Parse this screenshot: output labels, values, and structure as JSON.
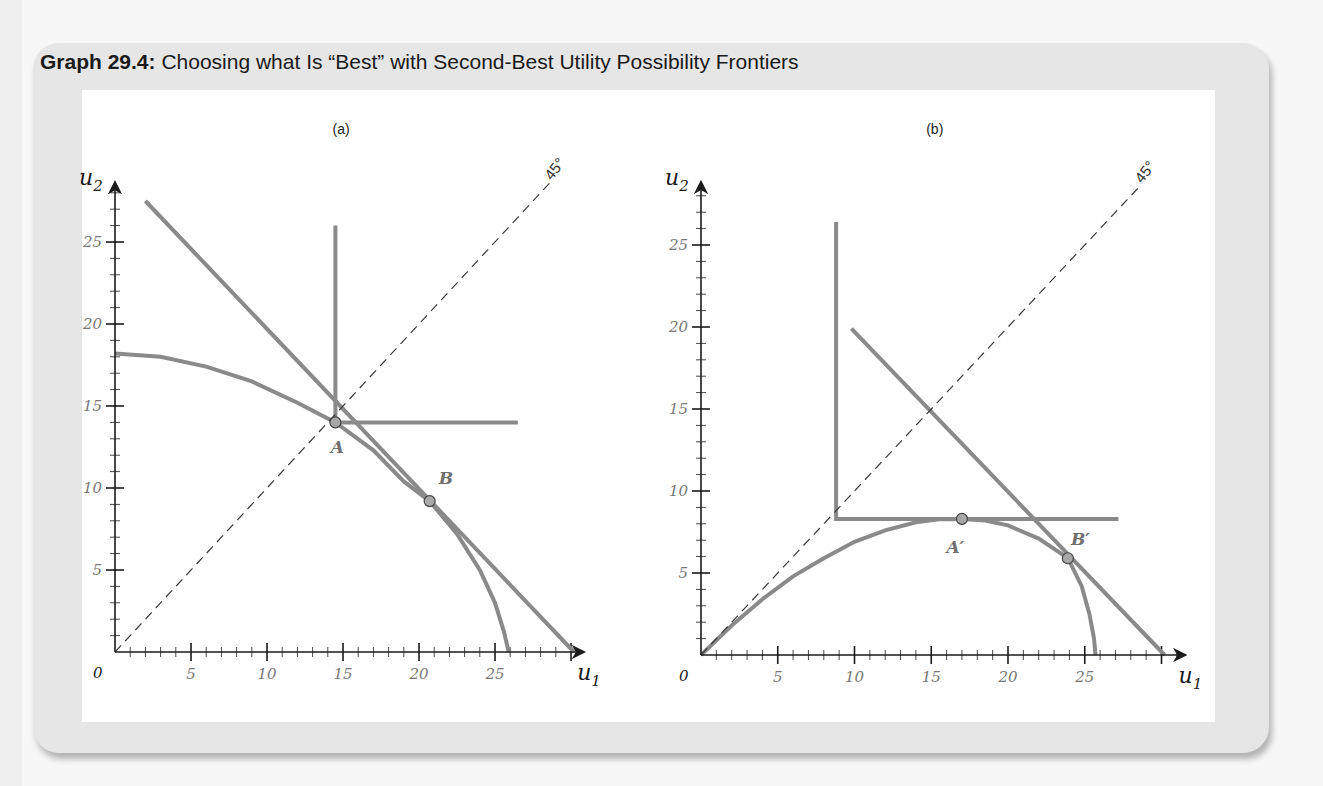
{
  "header": {
    "title_bold": "Graph 29.4:",
    "title_rest": " Choosing what Is “Best” with Second-Best Utility Possibility Frontiers"
  },
  "colors": {
    "curve": "#8a8a8a",
    "axis": "#1a1a1a",
    "tick_label": "#777777",
    "point_fill": "#a8a8a8",
    "point_stroke": "#444444",
    "point_label": "#6f6f6f"
  },
  "chart_data": [
    {
      "type": "line",
      "panel_label": "(a)",
      "title": "",
      "xlabel": "u1",
      "ylabel": "u2",
      "origin_label": "0",
      "xlim": [
        0,
        30.8
      ],
      "ylim": [
        0,
        28.6
      ],
      "xticks": [
        5,
        10,
        15,
        20,
        25
      ],
      "yticks": [
        5,
        10,
        15,
        20,
        25
      ],
      "minor_tick_step": 1,
      "grid": false,
      "pixel_map": {
        "x0": 115,
        "y0": 652,
        "sx": 15.2,
        "sy": 16.4
      },
      "diagonal_label": "45°",
      "series": [
        {
          "name": "Utility possibility frontier (curved)",
          "style": "solid",
          "points": [
            [
              0,
              18.2
            ],
            [
              3,
              18.0
            ],
            [
              6,
              17.4
            ],
            [
              9,
              16.5
            ],
            [
              12,
              15.2
            ],
            [
              14.5,
              14.0
            ],
            [
              17,
              12.3
            ],
            [
              19,
              10.4
            ],
            [
              20.7,
              9.2
            ],
            [
              22.5,
              7.2
            ],
            [
              24,
              5.0
            ],
            [
              25,
              3.0
            ],
            [
              25.6,
              1.2
            ],
            [
              25.9,
              0
            ]
          ]
        },
        {
          "name": "Straight utility possibility frontier",
          "style": "solid",
          "points": [
            [
              2.0,
              27.5
            ],
            [
              30.2,
              0
            ]
          ]
        },
        {
          "name": "Rawlsian indifference curve (L-shaped)",
          "style": "solid",
          "points": [
            [
              14.5,
              26.0
            ],
            [
              14.5,
              14.0
            ],
            [
              26.5,
              14.0
            ]
          ]
        },
        {
          "name": "45-degree line",
          "style": "dashed",
          "points": [
            [
              0,
              0
            ],
            [
              28.6,
              28.6
            ]
          ]
        }
      ],
      "points": [
        {
          "label": "A",
          "x": 14.5,
          "y": 14.0,
          "label_dx": -0.3,
          "label_dy": -1.5
        },
        {
          "label": "B",
          "x": 20.7,
          "y": 9.2,
          "label_dx": 0.6,
          "label_dy": 1.4
        }
      ]
    },
    {
      "type": "line",
      "panel_label": "(b)",
      "title": "",
      "xlabel": "u1",
      "ylabel": "u2",
      "origin_label": "0",
      "xlim": [
        0,
        31.5
      ],
      "ylim": [
        0,
        28.8
      ],
      "xticks": [
        5,
        10,
        15,
        20,
        25
      ],
      "yticks": [
        5,
        10,
        15,
        20,
        25
      ],
      "minor_tick_step": 1,
      "grid": false,
      "pixel_map": {
        "x0": 701,
        "y0": 655,
        "sx": 15.35,
        "sy": 16.4
      },
      "diagonal_label": "45°",
      "series": [
        {
          "name": "Second-best utility possibility frontier (curved)",
          "style": "solid",
          "points": [
            [
              0,
              0
            ],
            [
              2,
              1.8
            ],
            [
              4,
              3.4
            ],
            [
              6,
              4.8
            ],
            [
              8,
              5.9
            ],
            [
              10,
              6.9
            ],
            [
              12,
              7.6
            ],
            [
              14,
              8.1
            ],
            [
              15.5,
              8.28
            ],
            [
              17,
              8.3
            ],
            [
              18.5,
              8.2
            ],
            [
              20,
              7.9
            ],
            [
              22,
              7.1
            ],
            [
              23.9,
              5.9
            ],
            [
              24.8,
              4.2
            ],
            [
              25.3,
              2.5
            ],
            [
              25.6,
              1.0
            ],
            [
              25.7,
              0
            ]
          ]
        },
        {
          "name": "Straight utility possibility frontier",
          "style": "solid",
          "points": [
            [
              9.8,
              19.9
            ],
            [
              30.2,
              0
            ]
          ]
        },
        {
          "name": "Rawlsian indifference curve (L-shaped)",
          "style": "solid",
          "points": [
            [
              8.8,
              26.4
            ],
            [
              8.8,
              8.3
            ],
            [
              27.2,
              8.3
            ]
          ]
        },
        {
          "name": "45-degree line",
          "style": "dashed",
          "points": [
            [
              0,
              0
            ],
            [
              28.6,
              28.6
            ]
          ]
        }
      ],
      "points": [
        {
          "label": "A′",
          "x": 17.0,
          "y": 8.3,
          "label_dx": -1.0,
          "label_dy": -1.7
        },
        {
          "label": "B′",
          "x": 23.9,
          "y": 5.9,
          "label_dx": 0.2,
          "label_dy": 1.2
        }
      ]
    }
  ]
}
